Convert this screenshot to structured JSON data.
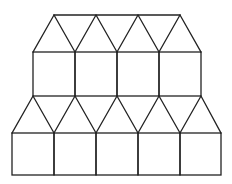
{
  "diagram": {
    "stroke_color": "#222222",
    "background": "#ffffff",
    "upper_band": {
      "apex_line": {
        "y": 15,
        "x_start": 54,
        "x_end": 180
      },
      "apex_xs": [
        54,
        96,
        138,
        180
      ],
      "base_y": 52,
      "base_xs": [
        33,
        75,
        117,
        159,
        201
      ],
      "square_count": 4,
      "square_top_y": 52,
      "square_bottom_y": 96
    },
    "lower_band": {
      "apex_y": 96,
      "apex_xs": [
        33,
        75,
        117,
        159,
        201
      ],
      "base_y": 133,
      "base_xs": [
        12,
        54,
        96,
        138,
        180,
        221
      ],
      "square_count": 5,
      "square_top_y": 133,
      "square_bottom_y": 175
    }
  }
}
